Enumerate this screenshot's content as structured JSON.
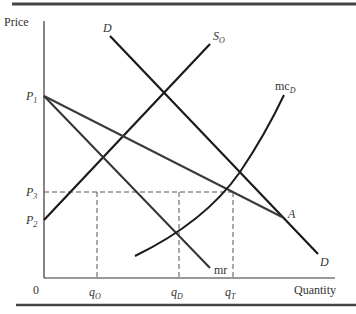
{
  "diagram": {
    "type": "economics-supply-demand",
    "axes": {
      "y_label": "Price",
      "x_label": "Quantity",
      "origin": "0"
    },
    "price_levels": [
      {
        "name": "P",
        "sub": "1"
      },
      {
        "name": "P",
        "sub": "3"
      },
      {
        "name": "P",
        "sub": "2"
      }
    ],
    "quantities": [
      {
        "name": "q",
        "sub": "O"
      },
      {
        "name": "q",
        "sub": "D"
      },
      {
        "name": "q",
        "sub": "T"
      }
    ],
    "curves": {
      "demand_top": "D",
      "demand_bottom": "D",
      "supply": {
        "name": "S",
        "sub": "O"
      },
      "marginal_cost": {
        "name": "mc",
        "sub": "D"
      },
      "marginal_revenue": "mr",
      "kink_point": "A"
    },
    "colors": {
      "line": "#1a1a1a",
      "rule": "#444444",
      "dash": "#555555"
    }
  }
}
